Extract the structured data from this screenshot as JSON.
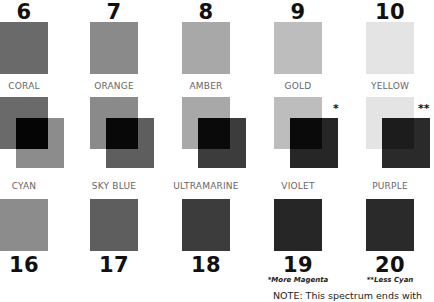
{
  "top_row": [
    {
      "number": "6",
      "label": "CORAL",
      "color": "#6a6a6a"
    },
    {
      "number": "7",
      "label": "ORANGE",
      "color": "#8a8a8a"
    },
    {
      "number": "8",
      "label": "AMBER",
      "color": "#a8a8a8"
    },
    {
      "number": "9",
      "label": "GOLD",
      "color": "#bdbdbd"
    },
    {
      "number": "10",
      "label": "YELLOW",
      "color": "#e4e4e4"
    }
  ],
  "overlap_row": [
    {
      "back_color": "#6a6a6a",
      "front_color": "#8c8c8c",
      "overlap_color": "#050505",
      "mark": ""
    },
    {
      "back_color": "#8a8a8a",
      "front_color": "#5e5e5e",
      "overlap_color": "#080808",
      "mark": ""
    },
    {
      "back_color": "#a8a8a8",
      "front_color": "#3c3c3c",
      "overlap_color": "#0a0a0a",
      "mark": ""
    },
    {
      "back_color": "#bdbdbd",
      "front_color": "#262626",
      "overlap_color": "#0a0a0a",
      "mark": "*"
    },
    {
      "back_color": "#e4e4e4",
      "front_color": "#2a2a2a",
      "overlap_color": "#1c1c1c",
      "mark": "**"
    }
  ],
  "bottom_row": [
    {
      "number": "16",
      "label": "CYAN",
      "color": "#8c8c8c",
      "footnote": ""
    },
    {
      "number": "17",
      "label": "SKY BLUE",
      "color": "#5e5e5e",
      "footnote": ""
    },
    {
      "number": "18",
      "label": "ULTRAMARINE",
      "color": "#3c3c3c",
      "footnote": ""
    },
    {
      "number": "19",
      "label": "VIOLET",
      "color": "#262626",
      "footnote": "*More Magenta"
    },
    {
      "number": "20",
      "label": "PURPLE",
      "color": "#2a2a2a",
      "footnote": "**Less Cyan"
    }
  ],
  "note": "NOTE: This spectrum ends with"
}
